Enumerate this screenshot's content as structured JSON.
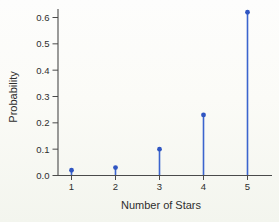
{
  "chart_data": {
    "type": "stem",
    "title": "",
    "xlabel": "Number of Stars",
    "ylabel": "Probability",
    "categories": [
      1,
      2,
      3,
      4,
      5
    ],
    "values": [
      0.02,
      0.03,
      0.1,
      0.23,
      0.62
    ],
    "series_name": "Probability distribution of number of stars",
    "xlim": [
      0.7,
      5.5
    ],
    "ylim": [
      0,
      0.64
    ],
    "yticks": [
      0.0,
      0.1,
      0.2,
      0.3,
      0.4,
      0.5,
      0.6
    ],
    "ytick_labels": [
      "0.0",
      "0.1",
      "0.2",
      "0.3",
      "0.4",
      "0.5",
      "0.6"
    ],
    "xticks": [
      1,
      2,
      3,
      4,
      5
    ],
    "xtick_labels": [
      "1",
      "2",
      "3",
      "4",
      "5"
    ],
    "grid": false,
    "legend_position": "none",
    "colors": {
      "stem": "#3b64ce",
      "marker": "#2f55c2",
      "axis": "#4a4a4a",
      "text": "#2e2e2e",
      "background": "#fbfbf7"
    }
  }
}
